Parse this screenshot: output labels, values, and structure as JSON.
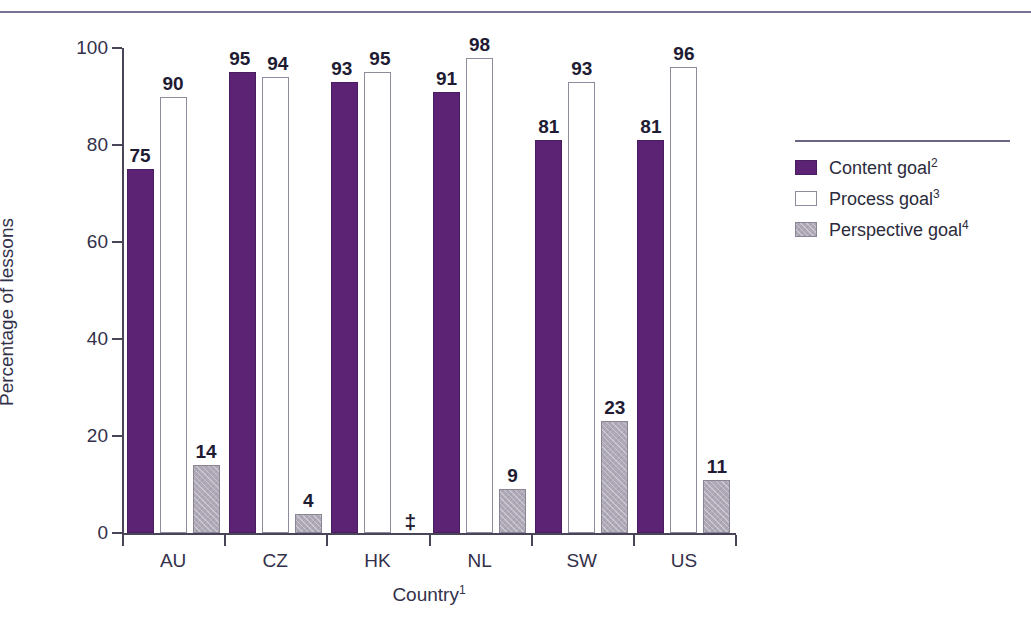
{
  "chart_data": {
    "type": "bar",
    "title": "",
    "xlabel": "Country",
    "xlabel_footnote": "1",
    "ylabel": "Percentage of lessons",
    "ylim": [
      0,
      100
    ],
    "yticks": [
      0,
      20,
      40,
      60,
      80,
      100
    ],
    "grid": false,
    "legend_position": "right",
    "categories": [
      "AU",
      "CZ",
      "HK",
      "NL",
      "SW",
      "US"
    ],
    "series": [
      {
        "name": "Content goal",
        "footnote": "2",
        "color": "#5C2375",
        "style": "filled-purple",
        "values": [
          75,
          95,
          93,
          91,
          81,
          81
        ],
        "labels": [
          "75",
          "95",
          "93",
          "91",
          "81",
          "81"
        ]
      },
      {
        "name": "Process goal",
        "footnote": "3",
        "color": "#FFFFFF",
        "style": "outlined-white",
        "values": [
          90,
          94,
          95,
          98,
          93,
          96
        ],
        "labels": [
          "90",
          "94",
          "95",
          "98",
          "93",
          "96"
        ]
      },
      {
        "name": "Perspective goal",
        "footnote": "4",
        "color": "#B0AAB8",
        "style": "hatched-gray",
        "values": [
          14,
          4,
          null,
          9,
          23,
          11
        ],
        "labels": [
          "14",
          "4",
          "‡",
          "9",
          "23",
          "11"
        ]
      }
    ],
    "suppressed_marker": "‡",
    "suppressed_note": "Reporting standards not met"
  },
  "axis": {
    "y_title": "Percentage of lessons",
    "x_title": "Country",
    "x_title_footnote": "1",
    "tick_labels": [
      "0",
      "20",
      "40",
      "60",
      "80",
      "100"
    ]
  },
  "legend": {
    "items": [
      {
        "label": "Content goal",
        "footnote": "2"
      },
      {
        "label": "Process goal",
        "footnote": "3"
      },
      {
        "label": "Perspective goal",
        "footnote": "4"
      }
    ]
  },
  "colors": {
    "content": "#5C2375",
    "process": "#FFFFFF",
    "perspective": "#B0AAB8",
    "rule": "#7A7292",
    "axis": "#4A4458",
    "text": "#2B2B3C"
  }
}
